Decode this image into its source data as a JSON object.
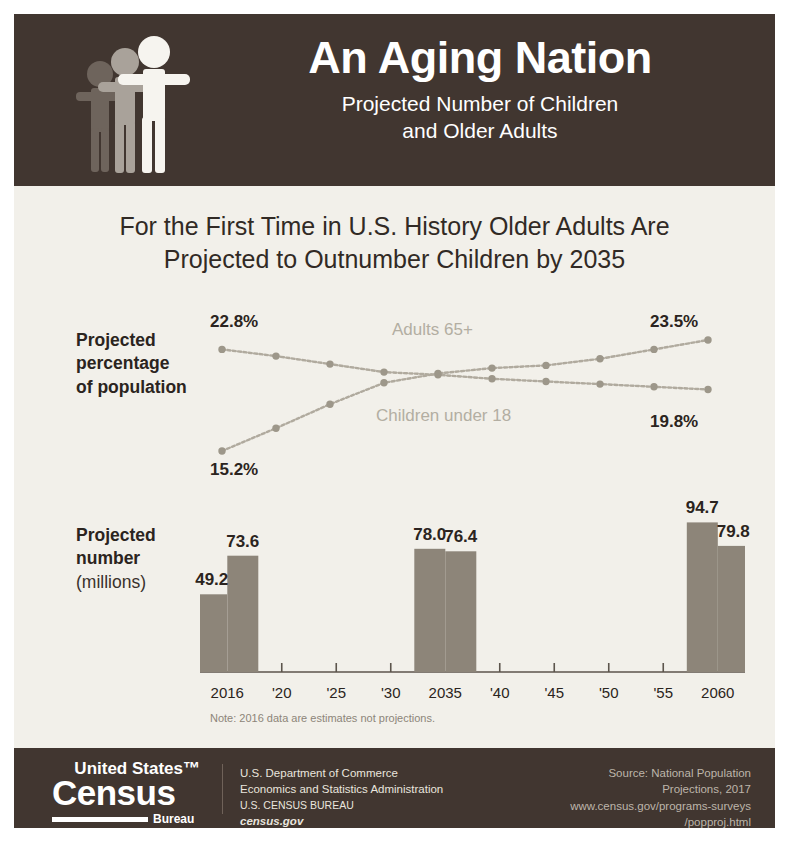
{
  "header": {
    "title": "An Aging Nation",
    "subtitle_line1": "Projected Number of Children",
    "subtitle_line2": "and Older Adults",
    "logo_icon": "three-people-icon",
    "background_color": "#413630"
  },
  "body": {
    "headline_line1": "For the First Time in U.S. History Older Adults Are",
    "headline_line2": "Projected to Outnumber Children by 2035",
    "background_color": "#f2f0ea"
  },
  "line_section": {
    "axis_label_line1": "Projected",
    "axis_label_line2": "percentage",
    "axis_label_line3": "of population"
  },
  "bar_section": {
    "axis_label_line1": "Projected",
    "axis_label_line2": "number",
    "axis_label_line3": "(millions)",
    "note": "Note: 2016 data are estimates not projections."
  },
  "footer": {
    "logo_united": "United States™",
    "logo_census": "Census",
    "logo_bureau": "Bureau",
    "dept_line1": "U.S. Department of Commerce",
    "dept_line2": "Economics and Statistics Administration",
    "dept_line3": "U.S. CENSUS BUREAU",
    "dept_line4": "census.gov",
    "source_line1": "Source: National Population",
    "source_line2": "Projections, 2017",
    "source_line3": "www.census.gov/programs-surveys",
    "source_line4": "/popproj.html",
    "background_color": "#413630"
  },
  "chart_data": [
    {
      "type": "line",
      "title": "Projected percentage of population",
      "xlabel": "",
      "ylabel": "Percent of population",
      "x": [
        2016,
        2020,
        2025,
        2030,
        2035,
        2040,
        2045,
        2050,
        2055,
        2060
      ],
      "ylim": [
        14,
        25
      ],
      "grid": false,
      "legend_position": "inline",
      "line_color": "#b0aa9e",
      "marker_color": "#9d978a",
      "series": [
        {
          "name": "Children under 18",
          "label": "Children under 18",
          "values": [
            22.8,
            22.3,
            21.7,
            21.1,
            20.9,
            20.6,
            20.4,
            20.2,
            20.0,
            19.8
          ],
          "start_label": "22.8%",
          "end_label": "19.8%"
        },
        {
          "name": "Adults 65+",
          "label": "Adults 65+",
          "values": [
            15.2,
            16.9,
            18.7,
            20.3,
            21.0,
            21.4,
            21.6,
            22.1,
            22.8,
            23.5
          ],
          "start_label": "15.2%",
          "end_label": "23.5%"
        }
      ]
    },
    {
      "type": "bar",
      "title": "Projected number (millions)",
      "xlabel": "",
      "ylabel": "Millions",
      "categories": [
        "2016",
        "'20",
        "'25",
        "'30",
        "2035",
        "'40",
        "'45",
        "'50",
        "'55",
        "2060"
      ],
      "plotted_years": [
        "2016",
        "2035",
        "2060"
      ],
      "ylim": [
        0,
        100
      ],
      "grid": false,
      "bar_color": "#8d8579",
      "series": [
        {
          "name": "Children under 18",
          "values": [
            73.6,
            76.4,
            79.8
          ],
          "labels": [
            "73.6",
            "76.4",
            "79.8"
          ]
        },
        {
          "name": "Adults 65+",
          "values": [
            49.2,
            78.0,
            94.7
          ],
          "labels": [
            "49.2",
            "78.0",
            "94.7"
          ]
        }
      ],
      "groups": [
        {
          "year": "2016",
          "bars": [
            {
              "value": 49.2,
              "label": "49.2"
            },
            {
              "value": 73.6,
              "label": "73.6"
            }
          ]
        },
        {
          "year": "2035",
          "bars": [
            {
              "value": 78.0,
              "label": "78.0"
            },
            {
              "value": 76.4,
              "label": "76.4"
            }
          ]
        },
        {
          "year": "2060",
          "bars": [
            {
              "value": 94.7,
              "label": "94.7"
            },
            {
              "value": 79.8,
              "label": "79.8"
            }
          ]
        }
      ]
    }
  ]
}
